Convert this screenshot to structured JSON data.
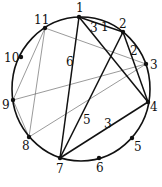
{
  "diagram": {
    "type": "circular-graph",
    "circle": {
      "cx": 81,
      "cy": 89,
      "rx": 69,
      "ry": 72
    },
    "nodes": [
      {
        "id": "1",
        "x": 79,
        "y": 17,
        "lx": 76,
        "ly": 12
      },
      {
        "id": "2",
        "x": 123,
        "y": 32,
        "lx": 119,
        "ly": 28
      },
      {
        "id": "3",
        "x": 146,
        "y": 64,
        "lx": 150,
        "ly": 69
      },
      {
        "id": "4",
        "x": 148,
        "y": 102,
        "lx": 150,
        "ly": 111
      },
      {
        "id": "5",
        "x": 132,
        "y": 138,
        "lx": 134,
        "ly": 151
      },
      {
        "id": "6",
        "x": 99,
        "y": 158,
        "lx": 96,
        "ly": 172
      },
      {
        "id": "7",
        "x": 60,
        "y": 158,
        "lx": 56,
        "ly": 173
      },
      {
        "id": "8",
        "x": 29,
        "y": 137,
        "lx": 22,
        "ly": 150
      },
      {
        "id": "9",
        "x": 13,
        "y": 100,
        "lx": 2,
        "ly": 109
      },
      {
        "id": "10",
        "x": 21,
        "y": 57,
        "lx": 4,
        "ly": 62
      },
      {
        "id": "11",
        "x": 45,
        "y": 28,
        "lx": 34,
        "ly": 24
      }
    ],
    "thick_edges": [
      {
        "from": "1",
        "to": "7",
        "weight": "6",
        "wx": 66,
        "wy": 66
      },
      {
        "from": "1",
        "to": "2",
        "weight": "1",
        "wx": 101,
        "wy": 31
      },
      {
        "from": "1",
        "to": "4",
        "weight": "3",
        "wx": 90,
        "wy": 32
      },
      {
        "from": "2",
        "to": "4",
        "weight": "2",
        "wx": 130,
        "wy": 55
      },
      {
        "from": "2",
        "to": "7",
        "weight": "5",
        "wx": 83,
        "wy": 124
      },
      {
        "from": "7",
        "to": "4",
        "weight": "3",
        "wx": 104,
        "wy": 128
      }
    ],
    "thin_edges": [
      {
        "from": "11",
        "to": "3"
      },
      {
        "from": "11",
        "to": "9"
      },
      {
        "from": "11",
        "to": "8"
      },
      {
        "from": "9",
        "to": "3"
      },
      {
        "from": "8",
        "to": "3"
      },
      {
        "from": "9",
        "to": "8"
      }
    ]
  }
}
